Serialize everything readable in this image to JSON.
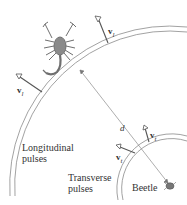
{
  "figure": {
    "labels": {
      "longitudinal": [
        "Longitudinal",
        "pulses"
      ],
      "transverse": [
        "Transverse",
        "pulses"
      ],
      "beetle": "Beetle",
      "distance": "d",
      "v_symbol": "v",
      "v_l_sub": "l",
      "v_t_sub": "t"
    },
    "colors": {
      "line": "#8a8a8a",
      "arrow": "#555555",
      "text": "#333333",
      "scorpion": "#6f6f6f"
    }
  }
}
